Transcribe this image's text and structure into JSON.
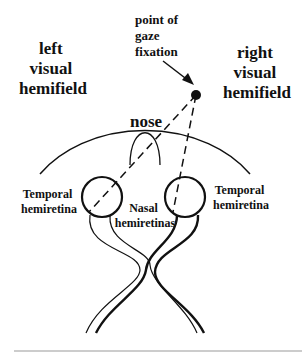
{
  "diagram": {
    "labels": {
      "left_hemifield": [
        "left",
        "visual",
        "hemifield"
      ],
      "right_hemifield": [
        "right",
        "visual",
        "hemifield"
      ],
      "fixation": [
        "point of",
        "gaze",
        "fixation"
      ],
      "nose": "nose",
      "left_temporal": [
        "Temporal",
        "hemiretina"
      ],
      "right_temporal": [
        "Temporal",
        "hemiretina"
      ],
      "nasal": [
        "Nasal",
        "hemiretinas"
      ]
    }
  }
}
